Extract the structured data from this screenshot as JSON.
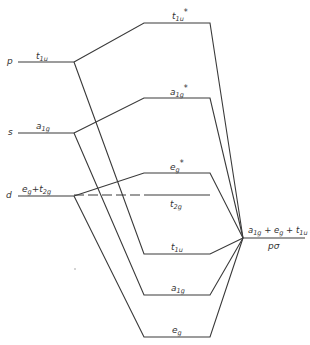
{
  "diagram": {
    "type": "molecular orbital energy-level diagram",
    "line_color": "#3a3a3a",
    "metal_levels": [
      {
        "id": "p",
        "orbital": "p",
        "symmetry": "t",
        "sub": "1u",
        "y": 62
      },
      {
        "id": "s",
        "orbital": "s",
        "symmetry": "a",
        "sub": "1g",
        "y": 133
      },
      {
        "id": "d",
        "orbital": "d",
        "symmetry_text": "e",
        "sub1": "g",
        "plus": "+",
        "t": "t",
        "sub2": "2g",
        "y": 196
      }
    ],
    "antibonding_levels": [
      {
        "id": "t1u_star",
        "symmetry": "t",
        "sub": "1u",
        "star": "*",
        "y": 23
      },
      {
        "id": "a1g_star",
        "symmetry": "a",
        "sub": "1g",
        "star": "*",
        "y": 98
      },
      {
        "id": "eg_star",
        "symmetry": "e",
        "sub": "g",
        "star": "*",
        "y": 173
      }
    ],
    "nonbonding_levels": [
      {
        "id": "t2g",
        "symmetry": "t",
        "sub": "2g",
        "y": 195
      }
    ],
    "bonding_levels": [
      {
        "id": "t1u",
        "symmetry": "t",
        "sub": "1u",
        "y": 254
      },
      {
        "id": "a1g",
        "symmetry": "a",
        "sub": "1g",
        "y": 295
      },
      {
        "id": "eg",
        "symmetry": "e",
        "sub": "g",
        "y": 337
      }
    ],
    "ligand_level": {
      "label_parts": {
        "a": "a",
        "a_sub": "1g",
        "plus1": "+",
        "e": "e",
        "e_sub": "g",
        "plus2": "+",
        "t": "t",
        "t_sub": "1u"
      },
      "name": "pσ",
      "y": 238
    }
  }
}
